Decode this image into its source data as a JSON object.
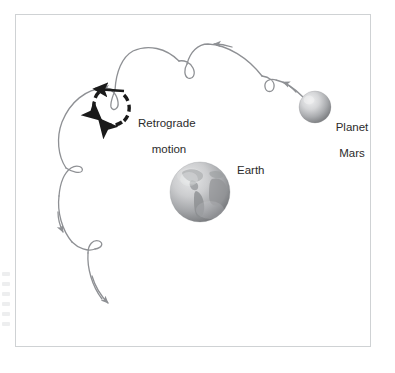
{
  "figure": {
    "background_color": "#ffffff",
    "frame_border_color": "#cfd2d4",
    "path_color": "#8e9094",
    "emphasis_color": "#1a1a1a",
    "text_color": "#2b2b2b"
  },
  "labels": {
    "retrograde": {
      "line1": "Retrograde",
      "line2": "motion"
    },
    "mars": {
      "line1": "Planet",
      "line2": "Mars"
    },
    "earth": "Earth"
  },
  "bodies": [
    {
      "name": "Mars",
      "label": "Planet Mars",
      "center": [
        315,
        107
      ],
      "radius": 16,
      "fill_light": "#e3e4e6",
      "fill_dark": "#8b8d90"
    },
    {
      "name": "Earth",
      "label": "Earth",
      "center": [
        200,
        192
      ],
      "radius": 30,
      "fill_light": "#dddedf",
      "fill_dark": "#86888b"
    }
  ],
  "apparent_path": {
    "description": "Looping apparent path of Mars against the background stars, traced from upper right to lower left with five cusp loops",
    "stroke_color": "#8e9094",
    "stroke_width": 1.3,
    "direction": "right-to-left",
    "loop_positions": [
      [
        268,
        84
      ],
      [
        190,
        71
      ],
      [
        111,
        104
      ],
      [
        78,
        172
      ],
      [
        97,
        246
      ]
    ],
    "arrowheads": [
      {
        "at": [
          288,
          72
        ],
        "points": "left"
      },
      {
        "at": [
          212,
          45
        ],
        "points": "left"
      },
      {
        "at": [
          101,
          88
        ],
        "points": "left"
      },
      {
        "at": [
          57,
          226
        ],
        "points": "down"
      },
      {
        "at": [
          111,
          304
        ],
        "points": "down-right"
      }
    ]
  },
  "retrograde_marker": {
    "description": "Thick dashed black arc with arrowheads indicating the westward retrograde loop",
    "color": "#1a1a1a",
    "center": [
      111,
      104
    ],
    "radius": 18,
    "dashed": true,
    "straight_arrow": {
      "from": [
        122,
        93
      ],
      "to": [
        89,
        90
      ],
      "points": "left"
    }
  },
  "margin_bleed": {
    "present": true,
    "description": "faint illegible bleed-through marks in the left page margin",
    "marks": [
      "",
      "",
      "",
      "",
      "",
      ""
    ]
  }
}
